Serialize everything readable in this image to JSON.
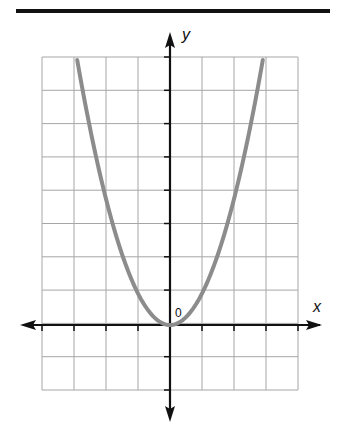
{
  "chart_data": {
    "type": "line",
    "title": "",
    "xlabel": "x",
    "ylabel": "y",
    "origin_label": "0",
    "grid": true,
    "xlim": [
      -4,
      4
    ],
    "ylim": [
      -2,
      8
    ],
    "x_ticks": [
      -4,
      -3,
      -2,
      -1,
      0,
      1,
      2,
      3,
      4
    ],
    "y_ticks": [
      -2,
      -1,
      0,
      1,
      2,
      3,
      4,
      5,
      6,
      7,
      8
    ],
    "tick_labels_shown": false,
    "series": [
      {
        "name": "parabola",
        "equation": "y = x^2",
        "color": "#8c8c8c",
        "x": [
          -2.9,
          -2.5,
          -2,
          -1.5,
          -1,
          -0.5,
          0,
          0.5,
          1,
          1.5,
          2,
          2.5,
          2.9
        ],
        "y": [
          8.4,
          6.25,
          4,
          2.25,
          1,
          0.25,
          0,
          0.25,
          1,
          2.25,
          4,
          6.25,
          8.4
        ]
      }
    ]
  },
  "colors": {
    "grid": "#a6a6a6",
    "axis": "#111111",
    "curve": "#8c8c8c"
  }
}
